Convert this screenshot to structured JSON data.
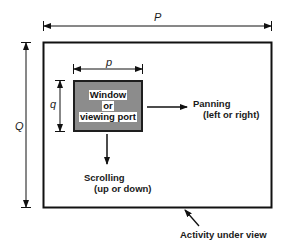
{
  "diagram": {
    "outer_width_label": "P",
    "outer_height_label": "Q",
    "window_width_label": "p",
    "window_height_label": "q",
    "window": {
      "lines": [
        "Window",
        "or",
        "viewing port"
      ],
      "fill_color": "#8c8c8c",
      "border_color": "#1e1e1e"
    },
    "panning": {
      "title": "Panning",
      "subtitle": "(left or right)"
    },
    "scrolling": {
      "title": "Scrolling",
      "subtitle": "(up or down)"
    },
    "activity_label": "Activity under view"
  }
}
